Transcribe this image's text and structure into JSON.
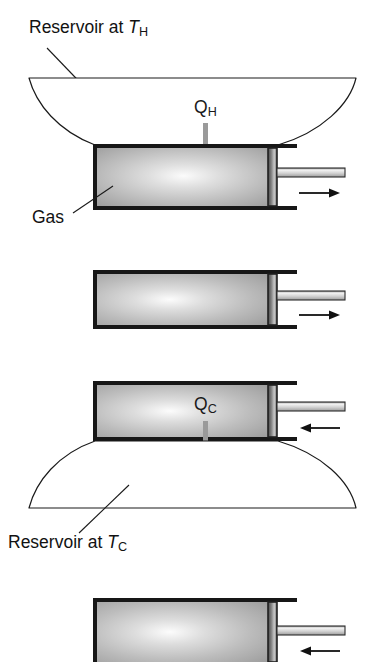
{
  "figure": {
    "background_color": "#ffffff",
    "line_color": "#1a1a1a",
    "gas_fill_light": "#f2f2f2",
    "gas_fill_mid": "#bdbdbd",
    "gas_fill_dark": "#8f8f8f",
    "heat_arrow_color": "#9a9a9a",
    "rod_fill_light": "#f0f0f0",
    "rod_fill_dark": "#b4b4b4",
    "piston_color": "#2b2b2b"
  },
  "labels": {
    "reservoir_hot": {
      "prefix": "Reservoir at ",
      "symbol": "T",
      "subscript": "H"
    },
    "reservoir_cold": {
      "prefix": "Reservoir at ",
      "symbol": "T",
      "subscript": "C"
    },
    "gas": "Gas",
    "heat_hot": {
      "symbol": "Q",
      "subscript": "H"
    },
    "heat_cold": {
      "symbol": "Q",
      "subscript": "C"
    }
  },
  "stages": [
    {
      "name": "isothermal-expansion",
      "index": 1,
      "reservoir": "hot",
      "heat_flow": "in",
      "heat_label": "Q_H",
      "piston_direction": "right",
      "piston_arrow_glyph": "→"
    },
    {
      "name": "adiabatic-expansion",
      "index": 2,
      "reservoir": "none",
      "heat_flow": "none",
      "heat_label": "",
      "piston_direction": "right",
      "piston_arrow_glyph": "→"
    },
    {
      "name": "isothermal-compression",
      "index": 3,
      "reservoir": "cold",
      "heat_flow": "out",
      "heat_label": "Q_C",
      "piston_direction": "left",
      "piston_arrow_glyph": "←"
    },
    {
      "name": "adiabatic-compression",
      "index": 4,
      "reservoir": "none",
      "heat_flow": "none",
      "heat_label": "",
      "piston_direction": "left",
      "piston_arrow_glyph": "←"
    }
  ]
}
